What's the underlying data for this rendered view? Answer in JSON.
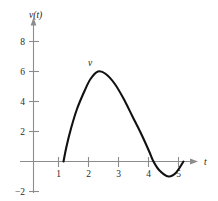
{
  "chart_data": {
    "type": "line",
    "title": "",
    "subtitle": "",
    "xlabel": "t",
    "ylabel": "v(t)",
    "series": [
      {
        "name": "v",
        "label": "v",
        "color": "#111111",
        "points": [
          {
            "x": 1.0,
            "y": 0.0
          },
          {
            "x": 1.1,
            "y": 1.0
          },
          {
            "x": 1.25,
            "y": 2.2
          },
          {
            "x": 1.45,
            "y": 3.5
          },
          {
            "x": 1.7,
            "y": 4.7
          },
          {
            "x": 1.9,
            "y": 5.5
          },
          {
            "x": 2.15,
            "y": 6.0
          },
          {
            "x": 2.4,
            "y": 5.85
          },
          {
            "x": 2.7,
            "y": 5.2
          },
          {
            "x": 3.0,
            "y": 4.2
          },
          {
            "x": 3.3,
            "y": 3.0
          },
          {
            "x": 3.6,
            "y": 1.8
          },
          {
            "x": 3.85,
            "y": 0.7
          },
          {
            "x": 4.0,
            "y": 0.0
          },
          {
            "x": 4.2,
            "y": -0.6
          },
          {
            "x": 4.5,
            "y": -1.0
          },
          {
            "x": 4.75,
            "y": -0.75
          },
          {
            "x": 5.0,
            "y": 0.0
          }
        ]
      }
    ],
    "xticks": [
      1,
      2,
      3,
      4,
      5
    ],
    "xtick_labels": [
      "1",
      "2",
      "3",
      "4",
      "5"
    ],
    "yticks": [
      -2,
      2,
      4,
      6,
      8
    ],
    "ytick_labels": [
      "−2",
      "2",
      "4",
      "6",
      "8"
    ],
    "xlim": [
      0,
      5.6
    ],
    "ylim": [
      -2.6,
      9.2
    ],
    "grid": false,
    "legend": "none",
    "annotations": [
      {
        "text": "v",
        "x": 2.15,
        "y": 6.0,
        "role": "curve-label"
      }
    ],
    "axis_color": "#8c8c8c",
    "curve_color": "#111111",
    "background": "#ffffff"
  }
}
